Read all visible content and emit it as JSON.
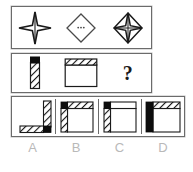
{
  "puzzle": {
    "type": "visual-analogy-matrix",
    "rows": {
      "shapes": {
        "name": "shape-sequence-row",
        "cells": [
          {
            "icon": "four-point-star-icon",
            "desc": "four-pointed star with vertical axis line"
          },
          {
            "icon": "diamond-icon",
            "desc": "plain diamond outline with small center dots"
          },
          {
            "icon": "diamond-with-star-icon",
            "desc": "diamond outline containing four-pointed star"
          }
        ]
      },
      "sequence": {
        "name": "problem-sequence-row",
        "cells": [
          {
            "icon": "hatched-vertical-bar-icon",
            "desc": "narrow vertical bar, black block on top, diagonal hatching below"
          },
          {
            "icon": "square-with-hatched-top-icon",
            "desc": "open square with diagonally hatched band across the top"
          },
          {
            "icon": "question-mark-icon",
            "label": "?"
          }
        ]
      },
      "options": {
        "name": "answer-options-row",
        "cells": [
          {
            "key": "A",
            "icon": "option-a-icon",
            "desc": "hatched vertical bar at right and hatched horizontal bar at bottom, black corner block at bottom-right"
          },
          {
            "key": "B",
            "icon": "option-b-icon",
            "desc": "square with hatched top band and hatched left band, black corner block at top-left"
          },
          {
            "key": "C",
            "icon": "option-c-icon",
            "desc": "square with plain thin top band and hatched left band, black corner block at top-left"
          },
          {
            "key": "D",
            "icon": "option-d-icon",
            "desc": "square with hatched top band and solid black left bar"
          }
        ]
      }
    },
    "option_labels": [
      "A",
      "B",
      "C",
      "D"
    ],
    "question_mark": "?",
    "colors": {
      "ink": "#1a1a1a",
      "panel_border": "#6b6b6b",
      "label_gray": "#b9b9b9",
      "background": "#ffffff",
      "hatch": "#1a1a1a"
    }
  }
}
